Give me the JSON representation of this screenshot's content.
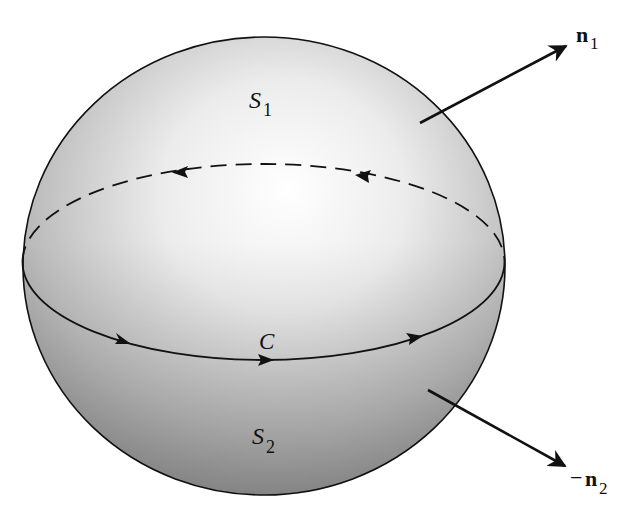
{
  "diagram": {
    "sphere": {
      "cx": 264,
      "cy": 266,
      "rx": 241,
      "ry": 229
    },
    "equator": {
      "cx": 263.5,
      "cy": 262,
      "rx": 241,
      "ry": 98
    },
    "labels": {
      "s1_main": "S",
      "s1_sub": "1",
      "s2_main": "S",
      "s2_sub": "2",
      "curve": "C",
      "n1_main": "n",
      "n1_sub": "1",
      "n2_prefix": "−",
      "n2_main": "n",
      "n2_sub": "2"
    },
    "vectors": [
      {
        "name": "n1",
        "from": [
          420,
          123
        ],
        "to": [
          568,
          45
        ]
      },
      {
        "name": "-n2",
        "from": [
          428,
          390
        ],
        "to": [
          567,
          467
        ]
      }
    ],
    "colors": {
      "stroke": "#111111",
      "sphere_highlight": "#ffffff",
      "sphere_mid": "#d9d9d9",
      "sphere_shadow": "#8a8a8a"
    }
  }
}
